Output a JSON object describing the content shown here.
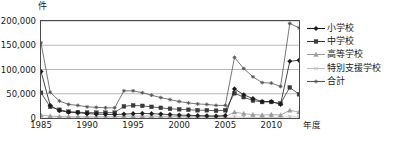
{
  "chart_data": {
    "type": "line",
    "title": "",
    "unit_label": "件",
    "xlabel": "年度",
    "ylabel": "",
    "ylim": [
      0,
      200000
    ],
    "yticks": [
      0,
      50000,
      100000,
      150000,
      200000
    ],
    "ytick_labels": [
      "0",
      "50,000",
      "100,000",
      "150,000",
      "200,000"
    ],
    "xlim": [
      1985,
      2013
    ],
    "xticks": [
      1985,
      1990,
      1995,
      2000,
      2005,
      2010
    ],
    "xtick_labels": [
      "1985",
      "1990",
      "1995",
      "2000",
      "2005",
      "2010"
    ],
    "grid": "horizontal",
    "legend_position": "right",
    "x": [
      1985,
      1986,
      1987,
      1988,
      1989,
      1990,
      1991,
      1992,
      1993,
      1994,
      1995,
      1996,
      1997,
      1998,
      1999,
      2000,
      2001,
      2002,
      2003,
      2004,
      2005,
      2006,
      2007,
      2008,
      2009,
      2010,
      2011,
      2012,
      2013
    ],
    "series": [
      {
        "name": "小学校",
        "color": "#1a1a1a",
        "marker": "diamond",
        "values": [
          96000,
          26000,
          15000,
          12000,
          11000,
          9000,
          8000,
          7500,
          7000,
          8000,
          9000,
          9500,
          9000,
          8000,
          7000,
          6000,
          5500,
          5000,
          4500,
          4000,
          5000,
          60000,
          48000,
          40000,
          34000,
          34000,
          28000,
          117000,
          119000
        ]
      },
      {
        "name": "中学校",
        "color": "#3a3a3a",
        "marker": "square",
        "values": [
          52000,
          23000,
          17000,
          13000,
          12000,
          11000,
          11000,
          11000,
          11000,
          24000,
          26000,
          25000,
          23000,
          21000,
          19000,
          18000,
          17000,
          16000,
          16000,
          15000,
          16000,
          51000,
          43000,
          36000,
          33000,
          33000,
          30000,
          63000,
          49000
        ]
      },
      {
        "name": "高等学校",
        "color": "#9a9a9a",
        "marker": "triangle",
        "values": [
          6000,
          4000,
          3000,
          2500,
          2500,
          2500,
          2500,
          2500,
          2500,
          4000,
          4000,
          4000,
          4000,
          3500,
          3500,
          3000,
          3000,
          3000,
          3000,
          3000,
          3000,
          12000,
          9000,
          7000,
          6000,
          7000,
          6000,
          16000,
          12000
        ]
      },
      {
        "name": "特別支援学校",
        "color": "#c0c0c0",
        "marker": "cross",
        "values": [
          300,
          250,
          250,
          250,
          250,
          250,
          250,
          250,
          250,
          400,
          400,
          400,
          400,
          400,
          400,
          400,
          400,
          400,
          400,
          400,
          400,
          2000,
          1500,
          1000,
          1000,
          1000,
          1000,
          2500,
          2000
        ]
      },
      {
        "name": "合計",
        "color": "#555555",
        "marker": "star",
        "values": [
          155000,
          53000,
          35000,
          28000,
          26000,
          23000,
          22000,
          21000,
          21000,
          56000,
          56000,
          52000,
          47000,
          42000,
          38000,
          34000,
          31000,
          29000,
          28000,
          26000,
          26000,
          125000,
          102000,
          85000,
          73000,
          72000,
          65000,
          195000,
          186000
        ]
      }
    ]
  }
}
